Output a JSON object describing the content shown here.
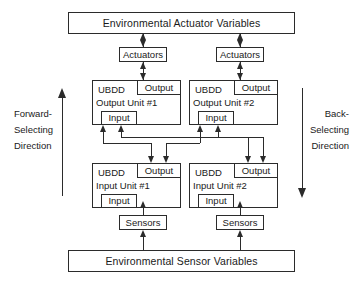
{
  "diagram": {
    "line_color": "#2b2b2b",
    "background_color": "#ffffff"
  },
  "environment": {
    "actuator_bar": "Environmental Actuator Variables",
    "sensor_bar": "Environmental Sensor Variables"
  },
  "transducers": {
    "actuators_left": "Actuators",
    "actuators_right": "Actuators",
    "sensors_left": "Sensors",
    "sensors_right": "Sensors"
  },
  "units": {
    "output_unit_1": {
      "ubdd": "UBDD",
      "title": "Output Unit #1",
      "output_port": "Output",
      "input_port": "Input"
    },
    "output_unit_2": {
      "ubdd": "UBDD",
      "title": "Output Unit #2",
      "output_port": "Output",
      "input_port": "Input"
    },
    "input_unit_1": {
      "ubdd": "UBDD",
      "title": "Input Unit #1",
      "output_port": "Output",
      "input_port": "Input"
    },
    "input_unit_2": {
      "ubdd": "UBDD",
      "title": "Input Unit #2",
      "output_port": "Output",
      "input_port": "Input"
    }
  },
  "direction_labels": {
    "forward": {
      "line1": "Forward-",
      "line2": "Selecting",
      "line3": "Direction"
    },
    "back": {
      "line1": "Back-",
      "line2": "Selecting",
      "line3": "Direction"
    }
  }
}
